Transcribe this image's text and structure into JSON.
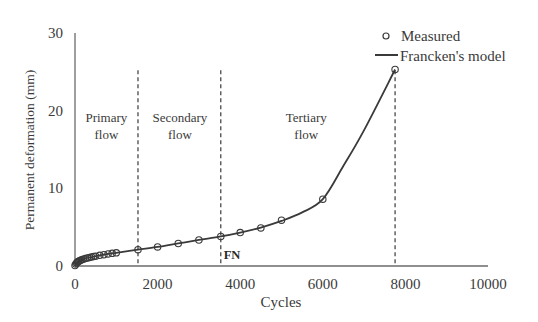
{
  "chart_data": {
    "type": "line",
    "title": "",
    "xlabel": "Cycles",
    "ylabel": "Permanent deformation (mm)",
    "xlim": [
      0,
      10000
    ],
    "ylim": [
      0,
      30
    ],
    "xticks": [
      0,
      2000,
      4000,
      6000,
      8000,
      10000
    ],
    "yticks": [
      0,
      10,
      20,
      30
    ],
    "xtick_labels": [
      "0",
      "2000",
      "4000",
      "6000",
      "8000",
      "10000"
    ],
    "ytick_labels": [
      "0",
      "10",
      "20",
      "30"
    ],
    "grid": false,
    "legend": {
      "placement": "top-right",
      "entries": [
        {
          "label": "Measured",
          "marker": "open-circle"
        },
        {
          "label": "Francken's model",
          "marker": "line"
        }
      ]
    },
    "series": [
      {
        "name": "Measured",
        "kind": "scatter",
        "marker": "open-circle",
        "x": [
          0,
          20,
          40,
          60,
          80,
          100,
          130,
          160,
          200,
          250,
          300,
          350,
          400,
          450,
          500,
          600,
          700,
          800,
          900,
          1000,
          1525,
          2000,
          2500,
          3000,
          3530,
          4000,
          4500,
          5000,
          6000,
          7750
        ],
        "y": [
          0.05,
          0.25,
          0.4,
          0.5,
          0.58,
          0.65,
          0.72,
          0.8,
          0.88,
          0.96,
          1.03,
          1.1,
          1.16,
          1.22,
          1.27,
          1.37,
          1.46,
          1.55,
          1.63,
          1.7,
          2.1,
          2.45,
          2.9,
          3.35,
          3.8,
          4.3,
          4.9,
          5.9,
          8.6,
          25.3
        ]
      },
      {
        "name": "Francken's model",
        "kind": "line",
        "x": [
          0,
          50,
          150,
          300,
          500,
          800,
          1000,
          1525,
          2000,
          2500,
          3000,
          3530,
          4000,
          4500,
          5000,
          5500,
          6000,
          6500,
          7000,
          7750
        ],
        "y": [
          0,
          0.45,
          0.78,
          1.03,
          1.27,
          1.55,
          1.7,
          2.1,
          2.45,
          2.9,
          3.35,
          3.8,
          4.3,
          4.95,
          5.8,
          6.9,
          8.6,
          12.9,
          17.5,
          25.3
        ]
      }
    ],
    "phase_boundaries": [
      {
        "x": 1525,
        "y_top": 25.2
      },
      {
        "x": 3530,
        "y_top": 25.2,
        "label": "FN"
      },
      {
        "x": 7750,
        "y_top": 25.2
      }
    ],
    "annotations": [
      {
        "lines": [
          "Primary",
          "flow"
        ],
        "x": 760,
        "y": 18.6
      },
      {
        "lines": [
          "Secondary",
          "flow"
        ],
        "x": 2540,
        "y": 18.6
      },
      {
        "lines": [
          "Tertiary",
          "flow"
        ],
        "x": 5600,
        "y": 18.6
      },
      {
        "text": "FN",
        "x": 3600,
        "y": 0.9
      }
    ],
    "colors": {
      "line": "#3a3a3a",
      "marker": "#3a3a3a",
      "axis": "#6a6a6a",
      "dashed": "#3a3a3a"
    }
  }
}
